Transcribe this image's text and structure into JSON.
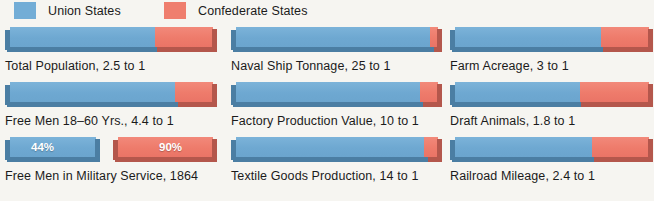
{
  "legend": {
    "items": [
      {
        "label": "Union States",
        "color": "#73add6",
        "swatch": "blue-swatch"
      },
      {
        "label": "Confederate States",
        "color": "#ef7e6e",
        "swatch": "red-swatch"
      }
    ]
  },
  "chart_data": {
    "type": "bar",
    "title": "",
    "subtitle": "",
    "xlabel": "",
    "ylabel": "",
    "orientation": "horizontal",
    "stacked": true,
    "grid": false,
    "legend_position": "top-left",
    "series": [
      {
        "name": "Union States",
        "color": "#73add6"
      },
      {
        "name": "Confederate States",
        "color": "#ef7e6e"
      }
    ],
    "categories": [
      "Total Population, 2.5 to 1",
      "Naval Ship Tonnage, 25 to 1",
      "Farm Acreage, 3 to 1",
      "Free Men 18–60 Yrs., 4.4 to 1",
      "Factory Production Value, 10 to 1",
      "Draft Animals, 1.8 to 1",
      "Free Men in Military Service, 1864",
      "Textile Goods Production, 14 to 1",
      "Railroad Mileage, 2.4 to 1"
    ],
    "bars": [
      {
        "label": "Total Population, 2.5 to 1",
        "ratio": "2.5 to 1",
        "union_pct": 71.4,
        "confederate_pct": 28.6
      },
      {
        "label": "Naval Ship Tonnage, 25 to 1",
        "ratio": "25 to 1",
        "union_pct": 96.2,
        "confederate_pct": 3.8
      },
      {
        "label": "Farm Acreage, 3 to 1",
        "ratio": "3 to 1",
        "union_pct": 75.0,
        "confederate_pct": 25.0
      },
      {
        "label": "Free Men 18–60 Yrs., 4.4 to 1",
        "ratio": "4.4 to 1",
        "union_pct": 81.5,
        "confederate_pct": 18.5
      },
      {
        "label": "Factory Production Value, 10 to 1",
        "ratio": "10 to 1",
        "union_pct": 90.9,
        "confederate_pct": 9.1
      },
      {
        "label": "Draft Animals, 1.8 to 1",
        "ratio": "1.8 to 1",
        "union_pct": 64.3,
        "confederate_pct": 35.7
      },
      {
        "label": "Textile Goods Production, 14 to 1",
        "ratio": "14 to 1",
        "union_pct": 93.3,
        "confederate_pct": 6.7
      },
      {
        "label": "Railroad Mileage, 2.4 to 1",
        "ratio": "2.4 to 1",
        "union_pct": 70.6,
        "confederate_pct": 29.4
      }
    ],
    "percent_pair": {
      "label": "Free Men in Military Service, 1864",
      "union": {
        "name": "Union States",
        "value": 44,
        "value_label": "44%"
      },
      "confederate": {
        "name": "Confederate States",
        "value": 90,
        "value_label": "90%"
      }
    }
  },
  "cells": {
    "c0": {
      "caption": "Total Population, 2.5 to 1",
      "union_pct": "71.4%",
      "confed_pct": "28.6%"
    },
    "c1": {
      "caption": "Naval Ship Tonnage, 25 to 1",
      "union_pct": "96.2%",
      "confed_pct": "3.8%"
    },
    "c2": {
      "caption": "Farm Acreage, 3 to 1",
      "union_pct": "75%",
      "confed_pct": "25%"
    },
    "c3": {
      "caption": "Free Men 18–60 Yrs., 4.4 to 1",
      "union_pct": "81.5%",
      "confed_pct": "18.5%"
    },
    "c4": {
      "caption": "Factory Production Value, 10 to 1",
      "union_pct": "90.9%",
      "confed_pct": "9.1%"
    },
    "c5": {
      "caption": "Draft Animals, 1.8 to 1",
      "union_pct": "64.3%",
      "confed_pct": "35.7%"
    },
    "c6": {
      "caption": "Free Men in Military Service, 1864",
      "union_label": "44%",
      "confed_label": "90%"
    },
    "c7": {
      "caption": "Textile Goods Production, 14 to 1",
      "union_pct": "93.3%",
      "confed_pct": "6.7%"
    },
    "c8": {
      "caption": "Railroad Mileage, 2.4 to 1",
      "union_pct": "70.6%",
      "confed_pct": "29.4%"
    }
  },
  "colors": {
    "union_blue": "#6ea8d1",
    "confederate_red": "#ee7b6b",
    "union_shadow": "#4b7ea3",
    "confederate_shadow": "#b4574c",
    "background": "#f6f5f1",
    "text": "#1b1b1b"
  }
}
